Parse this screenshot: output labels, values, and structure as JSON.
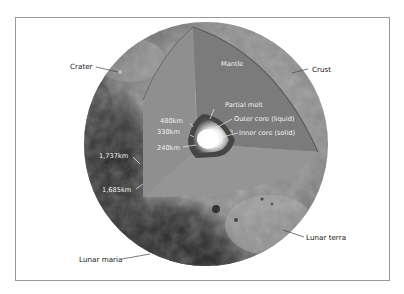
{
  "diagram": {
    "colors": {
      "background": "#ffffff",
      "frame_border": "#9a9a9a",
      "surface_light": "#9c9c9c",
      "surface_dark": "#2e2e2e",
      "left_face": "#8f8f8f",
      "mantle_face": "#7b7b7b",
      "bottom_face": "#959595",
      "partial_melt": "#4a4a4a",
      "outer_core": "#bdbdbd",
      "inner_core": "#ffffff",
      "label_dark": "#1a1a1a",
      "label_light": "#f2f2f2"
    },
    "external_labels": {
      "crater": "Crater",
      "crust": "Crust",
      "lunar_maria": "Lunar maria",
      "lunar_terra": "Lunar terra"
    },
    "layer_labels": {
      "mantle": "Mantle",
      "partial_melt": "Partial melt",
      "outer_core": "Outer core (liquid)",
      "inner_core": "Inner core (solid)"
    },
    "radius_labels": {
      "r480": "480km",
      "r330": "330km",
      "r240": "240km",
      "r1737": "1,737km",
      "r1685": "1,685km"
    }
  }
}
